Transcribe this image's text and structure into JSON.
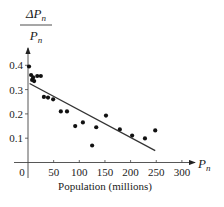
{
  "chart_data": {
    "type": "scatter",
    "title": "",
    "xlabel": "Population (millions)",
    "ylabel_numerator": "ΔP",
    "ylabel_denominator": "P",
    "ylabel_subscript": "n",
    "xaxis_end_label": "P",
    "xaxis_end_subscript": "n",
    "xlim": [
      -15,
      320
    ],
    "ylim": [
      0,
      0.45
    ],
    "xticks": [
      0,
      50,
      100,
      150,
      200,
      250,
      300
    ],
    "xtick_labels": [
      "0",
      "50",
      "100",
      "150",
      "200",
      "250",
      "300"
    ],
    "yticks": [
      0.1,
      0.2,
      0.3,
      0.4
    ],
    "ytick_labels": [
      "0.1",
      "0.2",
      "0.3",
      "0.4"
    ],
    "grid": false,
    "legend": "none",
    "series": [
      {
        "name": "data",
        "kind": "scatter",
        "x": [
          2,
          6,
          8,
          10,
          12,
          18,
          25,
          31,
          39,
          49,
          64,
          76,
          92,
          107,
          125,
          133,
          152,
          179,
          203,
          228,
          248
        ],
        "y": [
          0.395,
          0.36,
          0.34,
          0.35,
          0.335,
          0.356,
          0.356,
          0.27,
          0.267,
          0.26,
          0.21,
          0.21,
          0.15,
          0.165,
          0.07,
          0.145,
          0.193,
          0.136,
          0.111,
          0.099,
          0.132
        ]
      },
      {
        "name": "fit",
        "kind": "line",
        "x": [
          3,
          248
        ],
        "y": [
          0.325,
          0.049
        ]
      }
    ]
  }
}
